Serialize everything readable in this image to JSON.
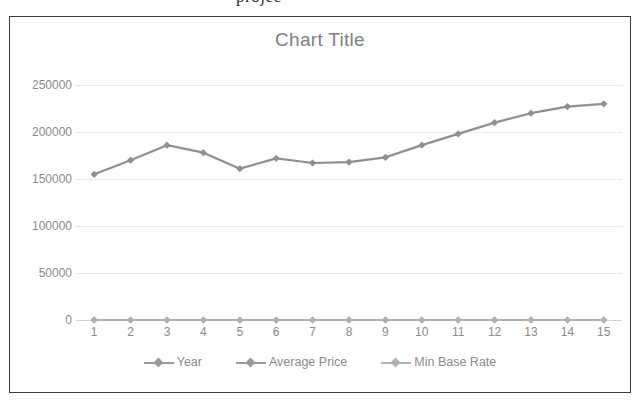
{
  "page": {
    "clipped_text_fragment": "projec"
  },
  "chart_frame": {
    "border_color": "#3d3d3d",
    "background": "#ffffff"
  },
  "legend": {
    "position": "bottom",
    "entries": [
      {
        "label": "Year",
        "color": "#9a9a9a",
        "marker": "diamond-marker"
      },
      {
        "label": "Average Price",
        "color": "#9a9a9a",
        "marker": "diamond-marker"
      },
      {
        "label": "Min Base Rate",
        "color": "#b0b0b0",
        "marker": "diamond-marker"
      }
    ]
  },
  "chart_data": {
    "type": "line",
    "title": "Chart Title",
    "xlabel": "",
    "ylabel": "",
    "x": [
      1,
      2,
      3,
      4,
      5,
      6,
      7,
      8,
      9,
      10,
      11,
      12,
      13,
      14,
      15
    ],
    "categories": [
      "1",
      "2",
      "3",
      "4",
      "5",
      "6",
      "7",
      "8",
      "9",
      "10",
      "11",
      "12",
      "13",
      "14",
      "15"
    ],
    "ylim": [
      0,
      250000
    ],
    "yticks": [
      0,
      50000,
      100000,
      150000,
      200000,
      250000
    ],
    "ytick_labels": [
      "0",
      "50000",
      "100000",
      "150000",
      "200000",
      "250000"
    ],
    "grid": true,
    "grid_style": "dotted horizontal",
    "legend_position": "bottom",
    "series": [
      {
        "name": "Year",
        "color": "#9a9a9a",
        "marker": "diamond",
        "values": [
          1,
          2,
          3,
          4,
          5,
          6,
          7,
          8,
          9,
          10,
          11,
          12,
          13,
          14,
          15
        ]
      },
      {
        "name": "Average Price",
        "color": "#8f8f8f",
        "marker": "diamond",
        "values": [
          155000,
          170000,
          186000,
          178000,
          161000,
          172000,
          167000,
          168000,
          173000,
          186000,
          198000,
          210000,
          220000,
          227000,
          230000
        ]
      },
      {
        "name": "Min Base Rate",
        "color": "#b0b0b0",
        "marker": "diamond",
        "values": [
          5,
          5,
          5,
          5,
          5,
          5,
          5,
          5,
          5,
          5,
          5,
          5,
          5,
          5,
          5
        ]
      }
    ]
  }
}
